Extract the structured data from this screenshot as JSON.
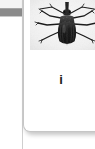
{
  "viewport": {
    "width": 95,
    "height": 149,
    "background_color": "#ffffff"
  },
  "left_panel_sliver": {
    "name": "adjacent-panel-edge",
    "band_color": "#8b8b8b",
    "background_color": "#ffffff",
    "divider_color": "#cfcfcf"
  },
  "card": {
    "background_color": "#ffffff",
    "border_color": "#c6c6c6",
    "shadow_color": "rgba(0,0,0,0.22)",
    "corner_radius_px": 7
  },
  "specimen": {
    "figure_name": "beetle-specimen-photo",
    "alt_description": "Grayscale dorsal view photograph of a weevil beetle specimen",
    "plate_background": "#f2f2f2",
    "body_color": "#1a1a1a",
    "caption": "i"
  }
}
